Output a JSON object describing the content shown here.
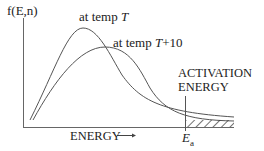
{
  "diagram": {
    "y_axis_label": "f(E,n)",
    "x_axis_label": "ENERGY",
    "x_axis_arrow": "→",
    "curve_low_temp_label_prefix": "at temp ",
    "curve_low_temp_var": "T",
    "curve_high_temp_label_prefix": "at temp ",
    "curve_high_temp_var": "T",
    "curve_high_temp_suffix": "+10",
    "threshold_label_line1": "ACTIVATION",
    "threshold_label_line2": "ENERGY",
    "threshold_symbol": "E",
    "threshold_subscript": "a",
    "line_color": "#555555"
  }
}
